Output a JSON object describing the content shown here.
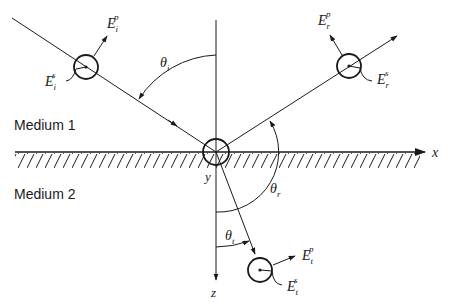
{
  "media": {
    "medium1": "Medium 1",
    "medium2": "Medium 2"
  },
  "axes": {
    "x": "x",
    "y": "y",
    "z": "z"
  },
  "angles": {
    "incident": {
      "symbol": "θ",
      "sub": "i"
    },
    "reflected": {
      "symbol": "θ",
      "sub": "r"
    },
    "transmitted": {
      "symbol": "θ",
      "sub": "t"
    }
  },
  "fields": {
    "incident_p": {
      "symbol": "E",
      "sub": "i",
      "sup": "p"
    },
    "incident_s": {
      "symbol": "E",
      "sub": "i",
      "sup": "s"
    },
    "reflected_p": {
      "symbol": "E",
      "sub": "r",
      "sup": "p"
    },
    "reflected_s": {
      "symbol": "E",
      "sub": "r",
      "sup": "s"
    },
    "transmitted_p": {
      "symbol": "E",
      "sub": "t",
      "sup": "p"
    },
    "transmitted_s": {
      "symbol": "E",
      "sub": "t",
      "sup": "s"
    }
  },
  "colors": {
    "ink": "#1a1a1a",
    "background": "#ffffff"
  }
}
